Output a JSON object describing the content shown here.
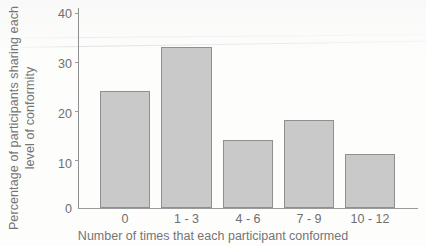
{
  "chart_data": {
    "type": "bar",
    "title": "",
    "subtitle": "",
    "categories": [
      "0",
      "1 - 3",
      "4 - 6",
      "7 - 9",
      "10 - 12"
    ],
    "values": [
      24,
      33,
      14,
      18,
      11
    ],
    "xlabel": "Number of times that each participant conformed",
    "ylabel_line1": "Percentage of participants sharing each",
    "ylabel_line2": "level of conformity",
    "ylim": [
      0,
      40
    ],
    "yticks": [
      0,
      10,
      20,
      30,
      40
    ],
    "ytick_labels": [
      "0",
      "10",
      "20",
      "30",
      "40"
    ],
    "grid": false,
    "legend": null,
    "bar_fill_color": "#c9c9c9",
    "bar_edge_color": "#8f8f8f",
    "axis_color": "#9a9a9a",
    "text_color": "#6f6f6f",
    "background_color": "#fdfdfc"
  }
}
